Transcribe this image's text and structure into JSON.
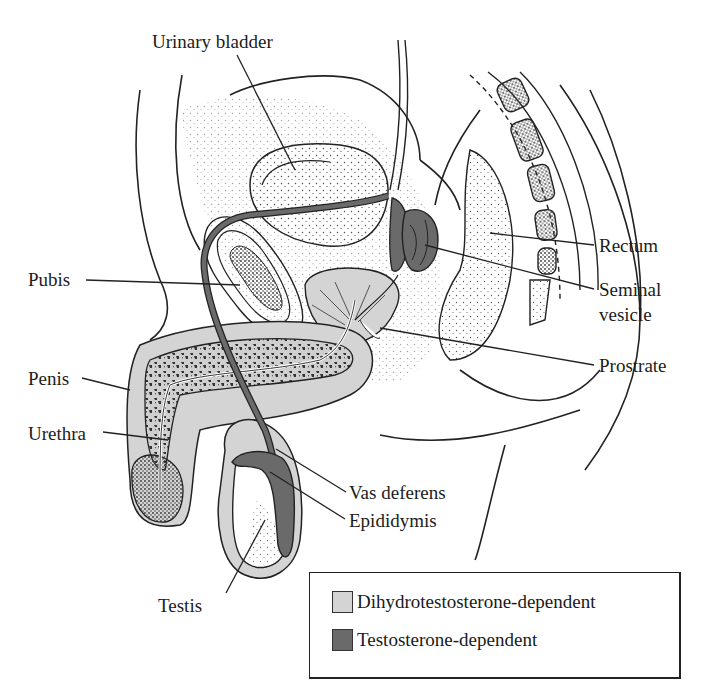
{
  "figure": {
    "colors": {
      "dht_fill": "#d4d4d4",
      "testosterone_fill": "#6a6a6a",
      "line": "#222222",
      "stipple": "#555555"
    }
  },
  "labels": {
    "urinary_bladder": "Urinary bladder",
    "pubis": "Pubis",
    "penis": "Penis",
    "urethra": "Urethra",
    "rectum": "Rectum",
    "seminal_vesicle_line1": "Seminal",
    "seminal_vesicle_line2": "vesicle",
    "prostate": "Prostrate",
    "vas_deferens": "Vas deferens",
    "epididymis": "Epididymis",
    "testis": "Testis"
  },
  "legend": {
    "items": [
      {
        "label": "Dihydrotestosterone-dependent",
        "color": "#d4d4d4"
      },
      {
        "label": "Testosterone-dependent",
        "color": "#6a6a6a"
      }
    ]
  }
}
